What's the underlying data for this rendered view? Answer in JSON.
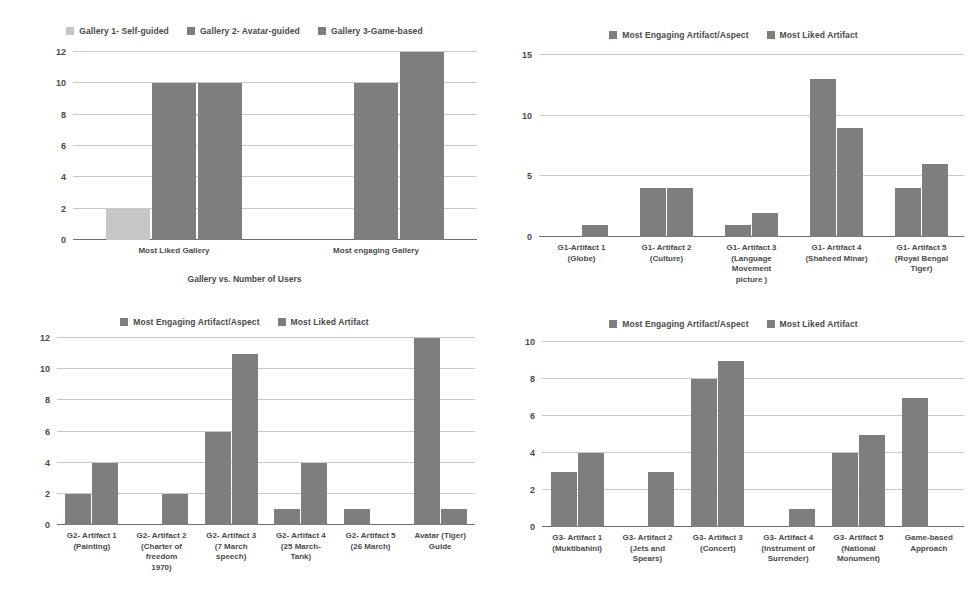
{
  "chart_data": [
    {
      "id": "gallery",
      "type": "bar",
      "title": "",
      "caption": "Gallery vs. Number of Users",
      "xlabel": "",
      "ylabel": "",
      "ylim": [
        0,
        12
      ],
      "yticks": [
        0,
        2,
        4,
        6,
        8,
        10,
        12
      ],
      "grid": true,
      "legend_position": "top",
      "categories": [
        "Most Liked Gallery",
        "Most engaging Gallery"
      ],
      "series": [
        {
          "name": "Gallery 1- Self-guided",
          "color": "#c6c6c6",
          "values": [
            2,
            0
          ]
        },
        {
          "name": "Gallery 2- Avatar-guided",
          "color": "#7e7e7e",
          "values": [
            10,
            10
          ]
        },
        {
          "name": "Gallery 3-Game-based",
          "color": "#7e7e7e",
          "values": [
            10,
            12
          ]
        }
      ]
    },
    {
      "id": "g1",
      "type": "bar",
      "title": "",
      "caption": "",
      "xlabel": "",
      "ylabel": "",
      "ylim": [
        0,
        15
      ],
      "yticks": [
        0,
        5,
        10,
        15
      ],
      "grid": true,
      "legend_position": "top",
      "categories": [
        [
          "G1-Artifact 1",
          "(Globe)"
        ],
        [
          "G1- Artifact 2",
          "(Culture)"
        ],
        [
          "G1- Artifact 3",
          "(Language",
          "Movement",
          "picture )"
        ],
        [
          "G1- Artifact 4",
          "(Shaheed Minar)"
        ],
        [
          "G1- Artifact 5",
          "(Royal Bengal",
          "Tiger)"
        ]
      ],
      "series": [
        {
          "name": "Most Engaging Artifact/Aspect",
          "color": "#7e7e7e",
          "values": [
            0,
            4,
            1,
            13,
            4
          ]
        },
        {
          "name": "Most Liked Artifact",
          "color": "#7e7e7e",
          "values": [
            1,
            4,
            2,
            9,
            6
          ]
        }
      ]
    },
    {
      "id": "g2",
      "type": "bar",
      "title": "",
      "caption": "",
      "xlabel": "",
      "ylabel": "",
      "ylim": [
        0,
        12
      ],
      "yticks": [
        0,
        2,
        4,
        6,
        8,
        10,
        12
      ],
      "grid": true,
      "legend_position": "top",
      "categories": [
        [
          "G2- Artifact 1",
          "(Painting)"
        ],
        [
          "G2- Artifact 2",
          "(Charter of",
          "freedom",
          "1970)"
        ],
        [
          "G2- Artifact 3",
          "(7 March",
          "speech)"
        ],
        [
          "G2- Artifact 4",
          "(25 March-",
          "Tank)"
        ],
        [
          "G2- Artifact 5",
          "(26 March)"
        ],
        [
          "Avatar (Tiger)",
          "Guide"
        ]
      ],
      "series": [
        {
          "name": "Most Engaging Artifact/Aspect",
          "color": "#7e7e7e",
          "values": [
            2,
            0,
            6,
            1,
            1,
            12
          ]
        },
        {
          "name": "Most Liked Artifact",
          "color": "#7e7e7e",
          "values": [
            4,
            2,
            11,
            4,
            0,
            1
          ]
        }
      ]
    },
    {
      "id": "g3",
      "type": "bar",
      "title": "",
      "caption": "",
      "xlabel": "",
      "ylabel": "",
      "ylim": [
        0,
        10
      ],
      "yticks": [
        0,
        2,
        4,
        6,
        8,
        10
      ],
      "grid": true,
      "legend_position": "top",
      "categories": [
        [
          "G3- Artifact 1",
          "(Muktibahini)"
        ],
        [
          "G3- Artifact 2",
          "(Jets and",
          "Spears)"
        ],
        [
          "G3- Artifact 3",
          "(Concert)"
        ],
        [
          "G3- Artifact 4",
          "(Instrument of",
          "Surrender)"
        ],
        [
          "G3- Artifact 5",
          "(National",
          "Monument)"
        ],
        [
          "Game-based",
          "Approach"
        ]
      ],
      "series": [
        {
          "name": "Most Engaging Artifact/Aspect",
          "color": "#7e7e7e",
          "values": [
            3,
            0,
            8,
            0,
            4,
            7
          ]
        },
        {
          "name": "Most Liked Artifact",
          "color": "#7e7e7e",
          "values": [
            4,
            3,
            9,
            1,
            5,
            0
          ]
        }
      ]
    }
  ],
  "colors": {
    "bar_dark": "#7e7e7e",
    "bar_light": "#c6c6c6",
    "gridline": "#c9c9c9",
    "axis": "#6e6e6e",
    "text": "#4a4a4a",
    "background": "#ffffff"
  }
}
